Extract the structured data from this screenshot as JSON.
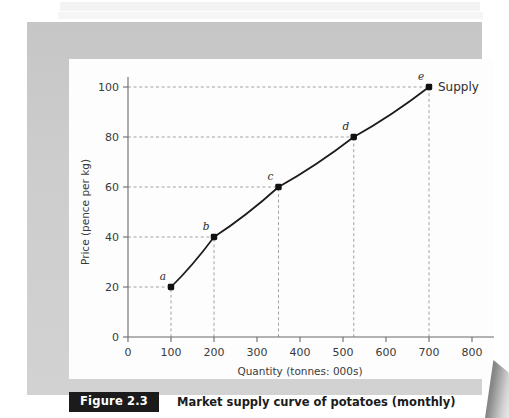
{
  "figure": {
    "badge_label": "Figure 2.3",
    "caption": "Market supply curve of potatoes (monthly)"
  },
  "colors": {
    "frame": "#c9c9c9",
    "plate": "#fdfdfd",
    "axis": "#6b6b6b",
    "grid": "#999999",
    "curve": "#1c1c1c",
    "marker": "#111111",
    "badge_bg": "#1b1b1b",
    "badge_text": "#ffffff"
  },
  "chart_data": {
    "type": "line",
    "title": "Market supply curve of potatoes (monthly)",
    "xlabel": "Quantity (tonnes: 000s)",
    "ylabel": "Price (pence per kg)",
    "xlim": [
      0,
      800
    ],
    "ylim": [
      0,
      100
    ],
    "xticks": [
      0,
      100,
      200,
      300,
      400,
      500,
      600,
      700,
      800
    ],
    "xtick_labels": [
      "0",
      "100",
      "200",
      "300",
      "400",
      "500",
      "600",
      "700",
      "800"
    ],
    "yticks": [
      0,
      20,
      40,
      60,
      80,
      100
    ],
    "ytick_labels": [
      "0",
      "20",
      "40",
      "60",
      "80",
      "100"
    ],
    "grid": "dashed-guides-to-points",
    "legend_position": "right-of-last-point",
    "series": [
      {
        "name": "Supply",
        "points": [
          {
            "label": "a",
            "x": 100,
            "y": 20
          },
          {
            "label": "b",
            "x": 200,
            "y": 40
          },
          {
            "label": "c",
            "x": 350,
            "y": 60
          },
          {
            "label": "d",
            "x": 525,
            "y": 80
          },
          {
            "label": "e",
            "x": 700,
            "y": 100
          }
        ]
      }
    ],
    "annotations": [
      {
        "text": "a",
        "for_point": "a"
      },
      {
        "text": "b",
        "for_point": "b"
      },
      {
        "text": "c",
        "for_point": "c"
      },
      {
        "text": "d",
        "for_point": "d"
      },
      {
        "text": "e",
        "for_point": "e"
      },
      {
        "text": "Supply",
        "for_point": "e"
      }
    ]
  }
}
